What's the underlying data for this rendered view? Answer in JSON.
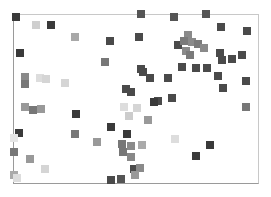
{
  "chart_data": {
    "type": "scatter",
    "title": "",
    "xlabel": "",
    "ylabel": "",
    "grid": false,
    "legend": null,
    "marker": "square",
    "plot_area": {
      "left": 13,
      "top": 14,
      "width": 246,
      "height": 170
    },
    "points": [
      {
        "x": 16,
        "y": 17,
        "c": "#3a3a3a"
      },
      {
        "x": 36,
        "y": 25,
        "c": "#cfcfcf"
      },
      {
        "x": 51,
        "y": 25,
        "c": "#3a3a3a"
      },
      {
        "x": 75,
        "y": 37,
        "c": "#a8a8a8"
      },
      {
        "x": 20,
        "y": 53,
        "c": "#3a3a3a"
      },
      {
        "x": 141,
        "y": 14,
        "c": "#555555"
      },
      {
        "x": 174,
        "y": 17,
        "c": "#555555"
      },
      {
        "x": 206,
        "y": 14,
        "c": "#555555"
      },
      {
        "x": 110,
        "y": 41,
        "c": "#4a4a4a"
      },
      {
        "x": 139,
        "y": 37,
        "c": "#4a4a4a"
      },
      {
        "x": 105,
        "y": 62,
        "c": "#777777"
      },
      {
        "x": 221,
        "y": 27,
        "c": "#4a4a4a"
      },
      {
        "x": 247,
        "y": 31,
        "c": "#4a4a4a"
      },
      {
        "x": 178,
        "y": 45,
        "c": "#4a4a4a"
      },
      {
        "x": 188,
        "y": 35,
        "c": "#8a8a8a"
      },
      {
        "x": 184,
        "y": 41,
        "c": "#7a7a7a"
      },
      {
        "x": 192,
        "y": 42,
        "c": "#8a8a8a"
      },
      {
        "x": 198,
        "y": 44,
        "c": "#7a7a7a"
      },
      {
        "x": 204,
        "y": 48,
        "c": "#8a8a8a"
      },
      {
        "x": 186,
        "y": 51,
        "c": "#8a8a8a"
      },
      {
        "x": 190,
        "y": 55,
        "c": "#7a7a7a"
      },
      {
        "x": 220,
        "y": 53,
        "c": "#4a4a4a"
      },
      {
        "x": 222,
        "y": 60,
        "c": "#4a4a4a"
      },
      {
        "x": 232,
        "y": 59,
        "c": "#4a4a4a"
      },
      {
        "x": 242,
        "y": 55,
        "c": "#4a4a4a"
      },
      {
        "x": 141,
        "y": 69,
        "c": "#4a4a4a"
      },
      {
        "x": 143,
        "y": 72,
        "c": "#4a4a4a"
      },
      {
        "x": 150,
        "y": 78,
        "c": "#4a4a4a"
      },
      {
        "x": 168,
        "y": 78,
        "c": "#4a4a4a"
      },
      {
        "x": 182,
        "y": 67,
        "c": "#4a4a4a"
      },
      {
        "x": 196,
        "y": 68,
        "c": "#4a4a4a"
      },
      {
        "x": 207,
        "y": 68,
        "c": "#4a4a4a"
      },
      {
        "x": 218,
        "y": 76,
        "c": "#4a4a4a"
      },
      {
        "x": 246,
        "y": 81,
        "c": "#4a4a4a"
      },
      {
        "x": 223,
        "y": 88,
        "c": "#4a4a4a"
      },
      {
        "x": 25,
        "y": 77,
        "c": "#8a8a8a"
      },
      {
        "x": 25,
        "y": 84,
        "c": "#777777"
      },
      {
        "x": 40,
        "y": 78,
        "c": "#dddddd"
      },
      {
        "x": 46,
        "y": 79,
        "c": "#d5d5d5"
      },
      {
        "x": 65,
        "y": 83,
        "c": "#d5d5d5"
      },
      {
        "x": 126,
        "y": 89,
        "c": "#4a4a4a"
      },
      {
        "x": 131,
        "y": 92,
        "c": "#4a4a4a"
      },
      {
        "x": 158,
        "y": 101,
        "c": "#4a4a4a"
      },
      {
        "x": 172,
        "y": 98,
        "c": "#4a4a4a"
      },
      {
        "x": 137,
        "y": 108,
        "c": "#d5d5d5"
      },
      {
        "x": 25,
        "y": 107,
        "c": "#999999"
      },
      {
        "x": 33,
        "y": 110,
        "c": "#777777"
      },
      {
        "x": 41,
        "y": 109,
        "c": "#999999"
      },
      {
        "x": 76,
        "y": 114,
        "c": "#3a3a3a"
      },
      {
        "x": 111,
        "y": 127,
        "c": "#3a3a3a"
      },
      {
        "x": 124,
        "y": 107,
        "c": "#dddddd"
      },
      {
        "x": 129,
        "y": 116,
        "c": "#cccccc"
      },
      {
        "x": 148,
        "y": 120,
        "c": "#999999"
      },
      {
        "x": 154,
        "y": 102,
        "c": "#3a3a3a"
      },
      {
        "x": 19,
        "y": 133,
        "c": "#3a3a3a"
      },
      {
        "x": 14,
        "y": 138,
        "c": "#e5e5e5"
      },
      {
        "x": 75,
        "y": 134,
        "c": "#777777"
      },
      {
        "x": 97,
        "y": 142,
        "c": "#999999"
      },
      {
        "x": 127,
        "y": 134,
        "c": "#3a3a3a"
      },
      {
        "x": 246,
        "y": 107,
        "c": "#777777"
      },
      {
        "x": 175,
        "y": 139,
        "c": "#dddddd"
      },
      {
        "x": 210,
        "y": 145,
        "c": "#3a3a3a"
      },
      {
        "x": 196,
        "y": 156,
        "c": "#3a3a3a"
      },
      {
        "x": 14,
        "y": 152,
        "c": "#777777"
      },
      {
        "x": 30,
        "y": 159,
        "c": "#999999"
      },
      {
        "x": 45,
        "y": 169,
        "c": "#d5d5d5"
      },
      {
        "x": 14,
        "y": 175,
        "c": "#aaaaaa"
      },
      {
        "x": 17,
        "y": 178,
        "c": "#dddddd"
      },
      {
        "x": 122,
        "y": 144,
        "c": "#777777"
      },
      {
        "x": 131,
        "y": 146,
        "c": "#8a8a8a"
      },
      {
        "x": 142,
        "y": 145,
        "c": "#aaaaaa"
      },
      {
        "x": 123,
        "y": 152,
        "c": "#777777"
      },
      {
        "x": 131,
        "y": 157,
        "c": "#888888"
      },
      {
        "x": 134,
        "y": 169,
        "c": "#4a4a4a"
      },
      {
        "x": 140,
        "y": 168,
        "c": "#8a8a8a"
      },
      {
        "x": 121,
        "y": 179,
        "c": "#555555"
      },
      {
        "x": 135,
        "y": 175,
        "c": "#999999"
      },
      {
        "x": 111,
        "y": 180,
        "c": "#4a4a4a"
      }
    ]
  }
}
